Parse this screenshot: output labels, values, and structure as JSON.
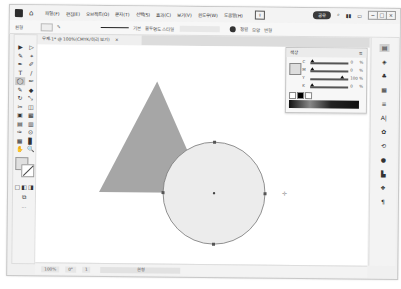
{
  "app": {
    "home_icon": "home-icon",
    "menus": [
      "파일(F)",
      "편집(E)",
      "오브젝트(O)",
      "문자(T)",
      "선택(S)",
      "효과(C)",
      "보기(V)",
      "윈도우(W)",
      "도움말(H)"
    ],
    "share_icon": "share-icon",
    "cloud_label": "공유",
    "search_icon": "search-icon",
    "window_controls": [
      "−",
      "□",
      "×"
    ]
  },
  "control_bar": {
    "selection_label": "원형",
    "stroke_label": "기본",
    "style_label": "불투명도 스타일",
    "align_labels": [
      "정렬",
      "모양",
      "변형"
    ],
    "zoom_icon": "collapse-icon"
  },
  "document": {
    "tab_title": "무제-1* @ 100%(CMYK/미리 보기)",
    "close_icon": "×"
  },
  "toolbar": {
    "tools": [
      "▶",
      "▷",
      "✎",
      "⌖",
      "✒",
      "✐",
      "T",
      "/",
      "◯",
      "✏",
      "✎",
      "◆",
      "↻",
      "⤡",
      "✂",
      "◫",
      "▣",
      "▦",
      "▤",
      "▥",
      "✑",
      "⊙",
      "▦",
      "▊",
      "✋",
      "🔍"
    ],
    "selected_index": 8,
    "mode_icons": [
      "▢",
      "◧",
      "◨"
    ],
    "more": "···"
  },
  "color_panel": {
    "title": "색상",
    "menu_icon": "≡",
    "rows": [
      {
        "label": "C",
        "value": "0",
        "pos": 0.05
      },
      {
        "label": "M",
        "value": "0",
        "pos": 0.05
      },
      {
        "label": "Y",
        "value": "100",
        "pos": 0.85
      },
      {
        "label": "K",
        "value": "0",
        "pos": 0.05
      }
    ],
    "unit": "%"
  },
  "canvas": {
    "triangle_color": "#a6a6a6",
    "circle_fill": "#ececec",
    "circle_stroke": "#777777"
  },
  "statusbar": {
    "zoom": "100%",
    "rotation": "0°",
    "artboard": "1",
    "tool_name": "원형"
  },
  "right_dock": {
    "icons": [
      "properties-icon",
      "layers-icon",
      "libraries-icon",
      "swatches-icon",
      "stroke-icon",
      "character-icon",
      "symbols-icon",
      "transform-icon",
      "appearance-icon",
      "align-icon",
      "pathfinder-icon",
      "paragraph-icon"
    ]
  }
}
